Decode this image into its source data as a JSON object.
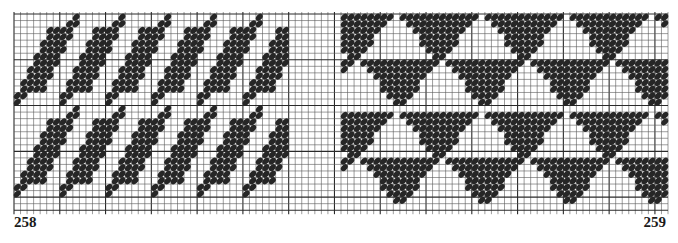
{
  "figure": {
    "labels": {
      "left": "258",
      "right": "259"
    },
    "colors": {
      "background": "#ffffff",
      "grid_minor": "#5a5a5a",
      "grid_major": "#2a2a2a",
      "stitch": "#262626"
    },
    "grid": {
      "x0": 14,
      "y0": 14,
      "cols": 100,
      "rows": 30,
      "cell": 6.54,
      "major_every_x": 7,
      "major_every_y": 7
    },
    "patterns": [
      {
        "id": "258",
        "name": "houndstooth-diagonal",
        "col_start": 0,
        "col_end": 42,
        "motif_w": 7,
        "motif_h": 14,
        "rows": 2
      },
      {
        "id": "259",
        "name": "triangles",
        "col_start": 50,
        "col_end": 100,
        "motif_w": 14,
        "motif_h": 11,
        "rows": 2
      }
    ]
  }
}
